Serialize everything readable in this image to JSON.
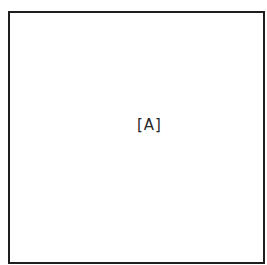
{
  "diagram": {
    "box_label": "[A]",
    "border_color": "#1e1e1e",
    "text_color": "#2a2a2a",
    "background_color": "#ffffff"
  }
}
